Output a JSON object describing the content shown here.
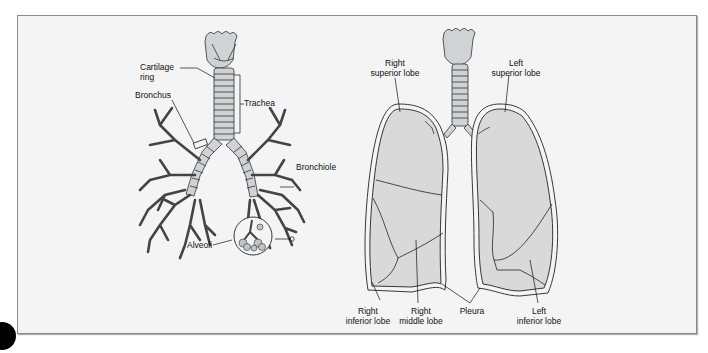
{
  "figure": {
    "left_panel": {
      "title": "Respiratory tree",
      "labels": {
        "cartilage_ring_1": "Cartilage",
        "cartilage_ring_2": "ring",
        "bronchus": "Bronchus",
        "trachea": "Trachea",
        "bronchiole": "Bronchiole",
        "alveoli": "Alveoli"
      }
    },
    "right_panel": {
      "title": "Lungs",
      "labels": {
        "right_superior_lobe_1": "Right",
        "right_superior_lobe_2": "superior lobe",
        "left_superior_lobe_1": "Left",
        "left_superior_lobe_2": "superior lobe",
        "right_inferior_lobe_1": "Right",
        "right_inferior_lobe_2": "inferior lobe",
        "right_middle_lobe_1": "Right",
        "right_middle_lobe_2": "middle lobe",
        "pleura": "Pleura",
        "left_inferior_lobe_1": "Left",
        "left_inferior_lobe_2": "inferior lobe"
      }
    },
    "colors": {
      "background": "#f4f4f4",
      "lung_fill": "#d9d9d9",
      "airway_fill": "#cfd3d3",
      "line": "#222222",
      "frame_border": "#8a8a8a"
    }
  }
}
